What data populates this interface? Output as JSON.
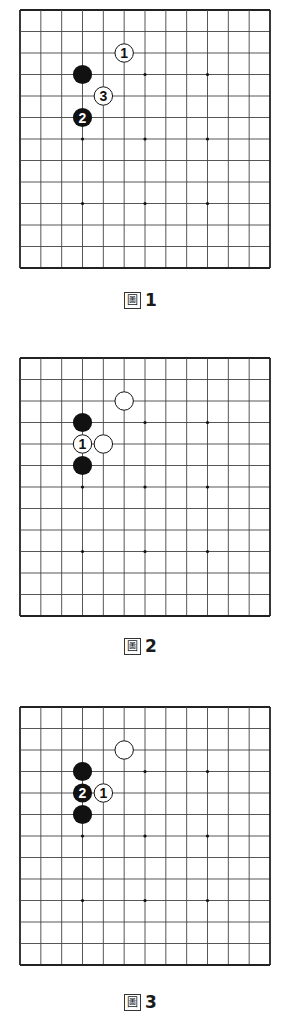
{
  "board": {
    "lines": 13,
    "star_points": [
      [
        3,
        3
      ],
      [
        6,
        3
      ],
      [
        9,
        3
      ],
      [
        3,
        6
      ],
      [
        6,
        6
      ],
      [
        9,
        6
      ],
      [
        3,
        9
      ],
      [
        6,
        9
      ],
      [
        9,
        9
      ]
    ],
    "colors": {
      "line": "#444444",
      "border": "#222222",
      "black_stone": "#111111",
      "white_stone": "#ffffff",
      "background": "#ffffff"
    }
  },
  "diagrams": [
    {
      "caption_prefix": "圖",
      "caption_number": "1",
      "stones": [
        {
          "color": "black",
          "col": 3,
          "row": 3,
          "label": ""
        },
        {
          "color": "white",
          "col": 5,
          "row": 2,
          "label": "1"
        },
        {
          "color": "white",
          "col": 4,
          "row": 4,
          "label": "3"
        },
        {
          "color": "black",
          "col": 3,
          "row": 5,
          "label": "2"
        }
      ]
    },
    {
      "caption_prefix": "圖",
      "caption_number": "2",
      "stones": [
        {
          "color": "white",
          "col": 5,
          "row": 2,
          "label": ""
        },
        {
          "color": "black",
          "col": 3,
          "row": 3,
          "label": ""
        },
        {
          "color": "white",
          "col": 3,
          "row": 4,
          "label": "1"
        },
        {
          "color": "white",
          "col": 4,
          "row": 4,
          "label": ""
        },
        {
          "color": "black",
          "col": 3,
          "row": 5,
          "label": ""
        }
      ]
    },
    {
      "caption_prefix": "圖",
      "caption_number": "3",
      "stones": [
        {
          "color": "white",
          "col": 5,
          "row": 2,
          "label": ""
        },
        {
          "color": "black",
          "col": 3,
          "row": 3,
          "label": ""
        },
        {
          "color": "black",
          "col": 3,
          "row": 4,
          "label": "2"
        },
        {
          "color": "white",
          "col": 4,
          "row": 4,
          "label": "1"
        },
        {
          "color": "black",
          "col": 3,
          "row": 5,
          "label": ""
        }
      ]
    }
  ]
}
